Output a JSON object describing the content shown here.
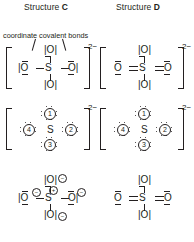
{
  "figure": {
    "columns": [
      {
        "id": "C",
        "title_prefix": "Structure ",
        "title_letter": "C"
      },
      {
        "id": "D",
        "title_prefix": "Structure ",
        "title_letter": "D"
      }
    ],
    "annotation": {
      "text": "coordinate covalent bonds",
      "icon": "leader-line"
    },
    "charge_label": "2−",
    "atoms": {
      "sulfur": "S",
      "oxygen": "O",
      "oxygen_left_line": "|O",
      "oxygen_right_line": "O|",
      "oxygen_vert_line": "|O|",
      "oxygen_bare": "O"
    },
    "formal_charges": {
      "negative": "−",
      "positive": "+"
    },
    "numbered_oxygens": [
      "1",
      "2",
      "3",
      "4"
    ],
    "colors": {
      "ink": "#231f20",
      "background": "#ffffff"
    },
    "rows": [
      {
        "id": "row1",
        "style": "line-bond-bracketed",
        "bracketed": true,
        "charge": "2−",
        "C": {
          "bond_left": "single",
          "bond_right": "single",
          "bond_top": "single",
          "bond_bottom": "single"
        },
        "D": {
          "bond_left": "double",
          "bond_right": "double",
          "bond_top": "single",
          "bond_bottom": "single"
        }
      },
      {
        "id": "row2",
        "style": "dot-numbered-bracketed",
        "bracketed": true,
        "charge": "2−",
        "C": {
          "oxygen_labels": [
            "1",
            "2",
            "3",
            "4"
          ]
        },
        "D": {
          "oxygen_labels": [
            "1",
            "2",
            "3",
            "4"
          ]
        }
      },
      {
        "id": "row3",
        "style": "formal-charge",
        "bracketed": false,
        "charge": "",
        "C": {
          "sulfur_charge": "+",
          "oxygen_charges": [
            "−",
            "−",
            "−",
            "−"
          ]
        },
        "D": {
          "sulfur_charge": "",
          "oxygen_charges": [
            "",
            "",
            "",
            ""
          ]
        }
      }
    ]
  }
}
